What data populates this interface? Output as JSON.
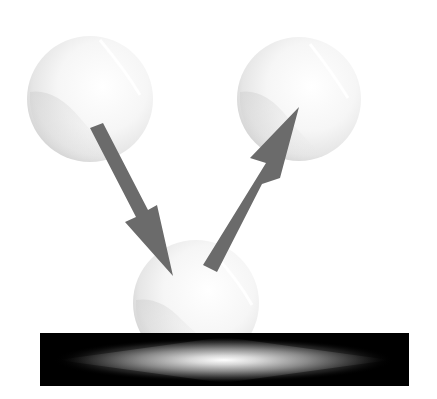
{
  "figure": {
    "title": "Ball bouncing off a surface",
    "colors": {
      "background": "#ffffff",
      "ball": "#f4f4f4",
      "ball_shadow": "#d8d8d8",
      "arrow": "#6b6b6b",
      "surface": "#000000",
      "glow_center": "#ffffff"
    },
    "elements": {
      "ball_incoming": {
        "label": "incoming ball",
        "cx": 90,
        "cy": 99,
        "r": 63
      },
      "ball_contact": {
        "label": "ball in contact with surface",
        "cx": 196,
        "cy": 300,
        "r": 63
      },
      "ball_outgoing": {
        "label": "rebounding ball",
        "cx": 299,
        "cy": 99,
        "r": 62
      },
      "arrow_down": {
        "label": "incoming direction arrow",
        "direction": "down-right"
      },
      "arrow_up": {
        "label": "rebound direction arrow",
        "direction": "up-right"
      },
      "surface": {
        "label": "surface"
      }
    }
  }
}
